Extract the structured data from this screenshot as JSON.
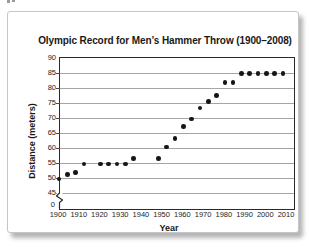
{
  "chart_data": {
    "type": "scatter",
    "title": "Olympic Record for Men’s Hammer Throw (1900–2008)",
    "xlabel": "Year",
    "ylabel": "Distance (meters)",
    "x_ticks": [
      "1900",
      "1910",
      "1920",
      "1930",
      "1940",
      "1950",
      "1960",
      "1970",
      "1980",
      "1990",
      "2000",
      "2010"
    ],
    "y_ticks": [
      90,
      85,
      80,
      75,
      70,
      65,
      60,
      55,
      50,
      45
    ],
    "y_break_label": "0",
    "y_axis_break": true,
    "xlim": [
      1900,
      2013
    ],
    "ylim": [
      45,
      90
    ],
    "grid": "horizontal-only",
    "legend": "none",
    "marker": "filled-circle",
    "colors": {
      "dot": "#161616",
      "grid": "#a5a5a5",
      "axis": "#2a2a2a"
    },
    "series": [
      {
        "name": "Olympic record distance (meters)",
        "points": [
          [
            1900,
            49.7
          ],
          [
            1904,
            51.2
          ],
          [
            1908,
            51.9
          ],
          [
            1912,
            54.7
          ],
          [
            1920,
            54.7
          ],
          [
            1924,
            54.7
          ],
          [
            1928,
            54.7
          ],
          [
            1932,
            54.7
          ],
          [
            1936,
            56.5
          ],
          [
            1948,
            56.5
          ],
          [
            1952,
            60.3
          ],
          [
            1956,
            63.2
          ],
          [
            1960,
            67.1
          ],
          [
            1964,
            69.7
          ],
          [
            1968,
            73.4
          ],
          [
            1972,
            75.5
          ],
          [
            1976,
            77.5
          ],
          [
            1980,
            81.8
          ],
          [
            1984,
            81.8
          ],
          [
            1988,
            84.8
          ],
          [
            1992,
            84.8
          ],
          [
            1996,
            84.8
          ],
          [
            2000,
            84.8
          ],
          [
            2004,
            84.8
          ],
          [
            2008,
            84.8
          ]
        ]
      }
    ]
  }
}
